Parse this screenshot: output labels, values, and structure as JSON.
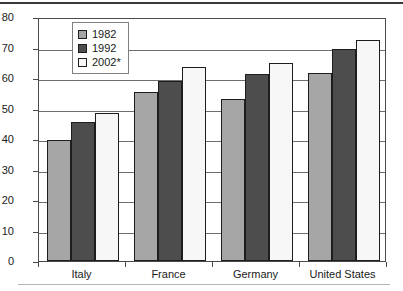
{
  "chart_data": {
    "type": "bar",
    "title": "",
    "xlabel": "",
    "ylabel": "",
    "ylim": [
      0,
      80
    ],
    "yticks": [
      0,
      10,
      20,
      30,
      40,
      50,
      60,
      70,
      80
    ],
    "grid": true,
    "legend_position": "top-left-inside",
    "categories": [
      "Italy",
      "France",
      "Germany",
      "United States"
    ],
    "series": [
      {
        "name": "1982",
        "color": "#a6a6a6",
        "values": [
          39.7,
          55.5,
          53.0,
          61.5
        ]
      },
      {
        "name": "1992",
        "color": "#4d4d4d",
        "values": [
          45.5,
          59.0,
          61.3,
          69.5
        ]
      },
      {
        "name": "2002*",
        "color": "#f7f7f7",
        "values": [
          48.5,
          63.5,
          65.0,
          72.5
        ]
      }
    ]
  },
  "legend": {
    "entries": [
      {
        "label": "1982"
      },
      {
        "label": "1992"
      },
      {
        "label": "2002*"
      }
    ]
  },
  "axes": {
    "y_tick_labels": [
      "80",
      "70",
      "60",
      "50",
      "40",
      "30",
      "20",
      "10",
      "0"
    ],
    "x_tick_labels": [
      "Italy",
      "France",
      "Germany",
      "United States"
    ]
  }
}
